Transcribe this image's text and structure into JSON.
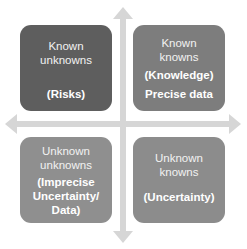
{
  "diagram": {
    "type": "2x2 quadrant matrix with crossing axis arrows",
    "colors": {
      "axis_arrow": "#d6d6d6",
      "top_left_box": "#5e5e5e",
      "top_right_box": "#7d7d7d",
      "bottom_left_box": "#8f8f8f",
      "bottom_right_box": "#8c8c8c",
      "text": "#f2f2f2"
    },
    "quadrants": {
      "top_left": {
        "title_lines": [
          "Known",
          "unknowns"
        ],
        "subtitle": "(Risks)"
      },
      "top_right": {
        "title_lines": [
          "Known",
          "knowns"
        ],
        "subtitle": "(Knowledge)",
        "note": "Precise data"
      },
      "bottom_left": {
        "title_lines": [
          "Unknown",
          "unknowns"
        ],
        "subtitle_lines": [
          "(Imprecise",
          "Uncertainty/",
          "Data)"
        ]
      },
      "bottom_right": {
        "title_lines": [
          "Unknown",
          "knowns"
        ],
        "subtitle": "(Uncertainty)"
      }
    },
    "axes": {
      "vertical": {
        "arrows": [
          "up",
          "down"
        ]
      },
      "horizontal": {
        "arrows": [
          "left",
          "right"
        ]
      }
    }
  }
}
